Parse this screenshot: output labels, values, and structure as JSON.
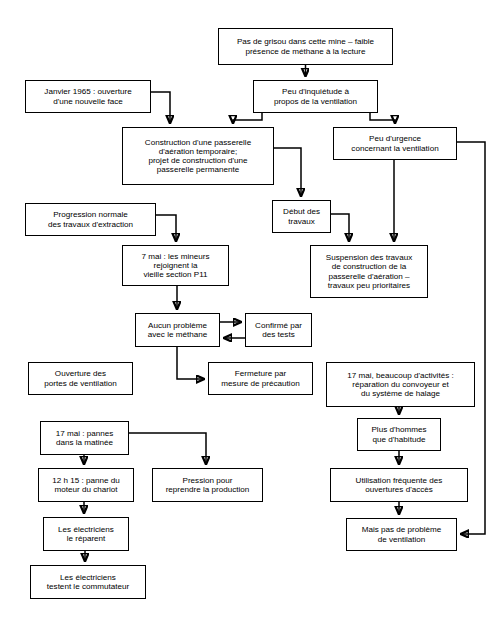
{
  "page": {
    "header_note": "",
    "background": "#ffffff",
    "line_color": "#000000",
    "box_border_color": "#000000"
  },
  "diagram": {
    "type": "flowchart",
    "title": "",
    "language": "fr",
    "nodes": [
      {
        "id": "n1",
        "text": "Pas de grisou dans cette mine – faible\nprésence de méthane à la lecture",
        "x": 218,
        "y": 28,
        "w": 175,
        "h": 37
      },
      {
        "id": "n2",
        "text": "Peu d'inquiétude à\npropos de la ventilation",
        "x": 253,
        "y": 80,
        "w": 125,
        "h": 33
      },
      {
        "id": "n3",
        "text": "Janvier 1965 : ouverture\nd'une nouvelle face",
        "x": 25,
        "y": 80,
        "w": 126,
        "h": 33
      },
      {
        "id": "n4",
        "text": "Construction d'une passerelle\nd'aération temporaire;\nprojet de construction d'une\npasserelle permanente",
        "x": 122,
        "y": 127,
        "w": 152,
        "h": 58
      },
      {
        "id": "n5",
        "text": "Peu d'urgence\nconcernant la ventilation",
        "x": 333,
        "y": 127,
        "w": 124,
        "h": 33
      },
      {
        "id": "n6",
        "text": "Progression normale\ndes travaux d'extraction",
        "x": 25,
        "y": 203,
        "w": 131,
        "h": 33
      },
      {
        "id": "n7",
        "text": "Début des\ntravaux",
        "x": 272,
        "y": 200,
        "w": 59,
        "h": 33
      },
      {
        "id": "n8",
        "text": "7 mai : les mineurs\nrejoignent la\nvieille section P11",
        "x": 122,
        "y": 245,
        "w": 107,
        "h": 41
      },
      {
        "id": "n9",
        "text": "Suspension des travaux\nde construction de la\npasserelle d'aération –\ntravaux peu prioritaires",
        "x": 310,
        "y": 245,
        "w": 118,
        "h": 53
      },
      {
        "id": "n10",
        "text": "Aucun problème\navec le méthane",
        "x": 135,
        "y": 313,
        "w": 85,
        "h": 34
      },
      {
        "id": "n11",
        "text": "Confirmé par\ndes tests",
        "x": 245,
        "y": 313,
        "w": 67,
        "h": 34
      },
      {
        "id": "n12",
        "text": "Ouverture des\nportes de ventilation",
        "x": 28,
        "y": 362,
        "w": 105,
        "h": 33
      },
      {
        "id": "n13",
        "text": "Fermeture par\nmesure de précaution",
        "x": 208,
        "y": 362,
        "w": 105,
        "h": 33
      },
      {
        "id": "n14",
        "text": "17 mai, beaucoup d'activités :\nréparation du convoyeur et\ndu système de halage",
        "x": 326,
        "y": 362,
        "w": 149,
        "h": 45
      },
      {
        "id": "n15",
        "text": "17 mai : pannes\ndans la matinée",
        "x": 40,
        "y": 421,
        "w": 89,
        "h": 34
      },
      {
        "id": "n16",
        "text": "Plus d'hommes\nque d'habitude",
        "x": 357,
        "y": 418,
        "w": 84,
        "h": 33
      },
      {
        "id": "n17",
        "text": "12 h 15 : panne du\nmoteur du chariot",
        "x": 38,
        "y": 468,
        "w": 96,
        "h": 34
      },
      {
        "id": "n18",
        "text": "Pression pour\nreprendre la production",
        "x": 152,
        "y": 468,
        "w": 111,
        "h": 34
      },
      {
        "id": "n19",
        "text": "Utilisation fréquente des\nouvertures d'accès",
        "x": 330,
        "y": 468,
        "w": 138,
        "h": 34
      },
      {
        "id": "n20",
        "text": "Les électriciens\nle réparent",
        "x": 43,
        "y": 517,
        "w": 86,
        "h": 34
      },
      {
        "id": "n21",
        "text": "Mais pas de problème\nde ventilation",
        "x": 346,
        "y": 518,
        "w": 111,
        "h": 33
      },
      {
        "id": "n22",
        "text": "Les électriciens\ntestent le commutateur",
        "x": 30,
        "y": 565,
        "w": 116,
        "h": 34
      }
    ],
    "edges": [
      {
        "from": "n1",
        "to": "n2",
        "d": "M 305.5 65 L 305.5 76"
      },
      {
        "from": "n2",
        "to": "n4",
        "d": "M 262 113 L 262 120 L 233 120 L 233 123"
      },
      {
        "from": "n2",
        "to": "n5",
        "d": "M 370 113 L 370 120 L 395 120 L 395 123"
      },
      {
        "from": "n3",
        "to": "n4",
        "d": "M 151 92 L 170 92 L 170 123"
      },
      {
        "from": "n4",
        "to": "n7",
        "d": "M 274 148 L 301 148 L 301 196"
      },
      {
        "from": "n5",
        "to": "n9",
        "d": "M 394 160 L 394 241"
      },
      {
        "from": "n5",
        "to": "n21",
        "d": "M 457 142 L 485 142 L 485 534 L 461 534"
      },
      {
        "from": "n6",
        "to": "n8",
        "d": "M 156 215 L 176 215 L 176 241"
      },
      {
        "from": "n7",
        "to": "n9",
        "d": "M 331 214 L 349 214 L 349 241"
      },
      {
        "from": "n8",
        "to": "n10",
        "d": "M 177 286 L 177 309"
      },
      {
        "from": "n10",
        "to": "n11",
        "d": "M 220 322 L 241 322"
      },
      {
        "from": "n11",
        "to": "n10",
        "d": "M 245 338 L 224 338"
      },
      {
        "from": "n10",
        "to": "n13",
        "d": "M 177 347 L 177 379 L 204 379"
      },
      {
        "from": "n14",
        "to": "n16",
        "d": "M 399 407 L 399 414"
      },
      {
        "from": "n15",
        "to": "n17",
        "d": "M 84 455 L 84 464"
      },
      {
        "from": "n15",
        "to": "n18",
        "d": "M 129 433 L 206 433 L 206 464"
      },
      {
        "from": "n16",
        "to": "n19",
        "d": "M 399 451 L 399 464"
      },
      {
        "from": "n17",
        "to": "n20",
        "d": "M 84 502 L 84 513"
      },
      {
        "from": "n19",
        "to": "n21",
        "d": "M 399 502 L 399 514"
      },
      {
        "from": "n20",
        "to": "n22",
        "d": "M 85 551 L 85 561"
      }
    ]
  }
}
